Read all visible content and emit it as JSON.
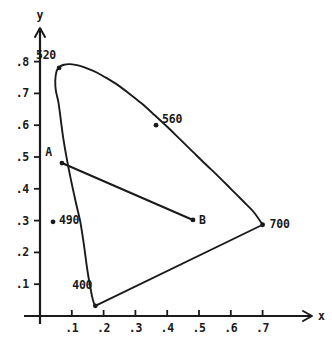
{
  "chart_data": {
    "type": "line",
    "title": "",
    "subtitle": "",
    "xlabel": "x",
    "ylabel": "y",
    "xlim": [
      0,
      0.78
    ],
    "ylim": [
      0,
      0.88
    ],
    "grid": false,
    "legend": "none",
    "x_ticks": [
      {
        "value": 0.1,
        "label": ".1"
      },
      {
        "value": 0.2,
        "label": ".2"
      },
      {
        "value": 0.3,
        "label": ".3"
      },
      {
        "value": 0.4,
        "label": ".4"
      },
      {
        "value": 0.5,
        "label": ".5"
      },
      {
        "value": 0.6,
        "label": ".6"
      },
      {
        "value": 0.7,
        "label": ".7"
      }
    ],
    "y_ticks": [
      {
        "value": 0.1,
        "label": ".1"
      },
      {
        "value": 0.2,
        "label": ".2"
      },
      {
        "value": 0.3,
        "label": ".3"
      },
      {
        "value": 0.4,
        "label": ".4"
      },
      {
        "value": 0.5,
        "label": ".5"
      },
      {
        "value": 0.6,
        "label": ".6"
      },
      {
        "value": 0.7,
        "label": ".7"
      },
      {
        "value": 0.8,
        "label": ".8"
      }
    ],
    "series": [
      {
        "name": "spectral-locus",
        "type": "line",
        "points": [
          [
            0.174,
            0.032
          ],
          [
            0.168,
            0.045
          ],
          [
            0.163,
            0.065
          ],
          [
            0.158,
            0.092
          ],
          [
            0.152,
            0.125
          ],
          [
            0.146,
            0.165
          ],
          [
            0.14,
            0.21
          ],
          [
            0.133,
            0.258
          ],
          [
            0.126,
            0.3
          ],
          [
            0.112,
            0.36
          ],
          [
            0.098,
            0.425
          ],
          [
            0.085,
            0.49
          ],
          [
            0.073,
            0.56
          ],
          [
            0.065,
            0.62
          ],
          [
            0.058,
            0.672
          ],
          [
            0.05,
            0.708
          ],
          [
            0.048,
            0.74
          ],
          [
            0.052,
            0.77
          ],
          [
            0.06,
            0.782
          ],
          [
            0.075,
            0.79
          ],
          [
            0.095,
            0.792
          ],
          [
            0.12,
            0.788
          ],
          [
            0.15,
            0.778
          ],
          [
            0.18,
            0.765
          ],
          [
            0.21,
            0.748
          ],
          [
            0.245,
            0.726
          ],
          [
            0.28,
            0.7
          ],
          [
            0.32,
            0.668
          ],
          [
            0.36,
            0.632
          ],
          [
            0.4,
            0.595
          ],
          [
            0.44,
            0.556
          ],
          [
            0.48,
            0.517
          ],
          [
            0.52,
            0.478
          ],
          [
            0.56,
            0.44
          ],
          [
            0.6,
            0.4
          ],
          [
            0.64,
            0.36
          ],
          [
            0.672,
            0.327
          ],
          [
            0.7,
            0.287
          ]
        ]
      },
      {
        "name": "purple-line",
        "type": "line",
        "points": [
          [
            0.7,
            0.287
          ],
          [
            0.174,
            0.032
          ]
        ]
      },
      {
        "name": "segment-AB",
        "type": "line",
        "points": [
          [
            0.069,
            0.481
          ],
          [
            0.481,
            0.302
          ]
        ]
      }
    ],
    "annotations": [
      {
        "name": "400",
        "label": "400",
        "x": 0.174,
        "y": 0.032,
        "label_dx": -3,
        "label_dy": -17,
        "marker": true
      },
      {
        "name": "490",
        "label": "490",
        "x": 0.041,
        "y": 0.296,
        "label_dx": 6,
        "label_dy": 2,
        "marker": true
      },
      {
        "name": "520",
        "label": "520",
        "x": 0.06,
        "y": 0.78,
        "label_dx": -3,
        "label_dy": -9,
        "marker": true
      },
      {
        "name": "560",
        "label": "560",
        "x": 0.365,
        "y": 0.6,
        "label_dx": 6,
        "label_dy": -2,
        "marker": true
      },
      {
        "name": "700",
        "label": "700",
        "x": 0.7,
        "y": 0.287,
        "label_dx": 7,
        "label_dy": 3,
        "marker": true
      },
      {
        "name": "A",
        "label": "A",
        "x": 0.069,
        "y": 0.481,
        "label_dx": -10,
        "label_dy": -7,
        "marker": true
      },
      {
        "name": "B",
        "label": "B",
        "x": 0.481,
        "y": 0.302,
        "label_dx": 6,
        "label_dy": 4,
        "marker": true
      }
    ]
  }
}
